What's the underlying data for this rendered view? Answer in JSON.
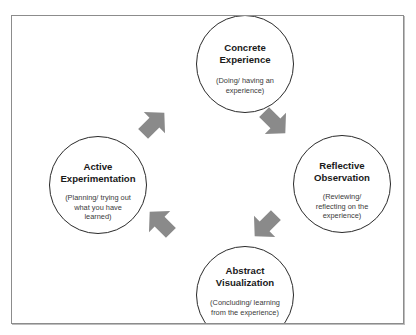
{
  "diagram": {
    "type": "cycle",
    "direction": "clockwise",
    "colors": {
      "frame_border": "#8c8c8c",
      "circle_border": "#2a2a2a",
      "arrow_fill": "#8a8a8a",
      "text": "#1a1a1a",
      "background": "#ffffff"
    },
    "nodes": [
      {
        "id": "concrete-experience",
        "title_line1": "Concrete",
        "title_line2": "Experience",
        "desc_line1": "(Doing/ having an",
        "desc_line2": "experience)",
        "position": "top"
      },
      {
        "id": "reflective-observation",
        "title_line1": "Reflective",
        "title_line2": "Observation",
        "desc_line1": "(Reviewing/",
        "desc_line2": "reflecting on the",
        "desc_line3": "experience)",
        "position": "right"
      },
      {
        "id": "abstract-visualization",
        "title_line1": "Abstract",
        "title_line2": "Visualization",
        "desc_line1": "(Concluding/ learning",
        "desc_line2": "from the experience)",
        "position": "bottom"
      },
      {
        "id": "active-experimentation",
        "title_line1": "Active",
        "title_line2": "Experimentation",
        "desc_line1": "(Planning/ trying out",
        "desc_line2": "what you have",
        "desc_line3": "learned)",
        "position": "left"
      }
    ],
    "edges": [
      {
        "from": "concrete-experience",
        "to": "reflective-observation",
        "arrow_direction": "down-right"
      },
      {
        "from": "reflective-observation",
        "to": "abstract-visualization",
        "arrow_direction": "down-left"
      },
      {
        "from": "abstract-visualization",
        "to": "active-experimentation",
        "arrow_direction": "up-left"
      },
      {
        "from": "active-experimentation",
        "to": "concrete-experience",
        "arrow_direction": "up-right"
      }
    ]
  }
}
